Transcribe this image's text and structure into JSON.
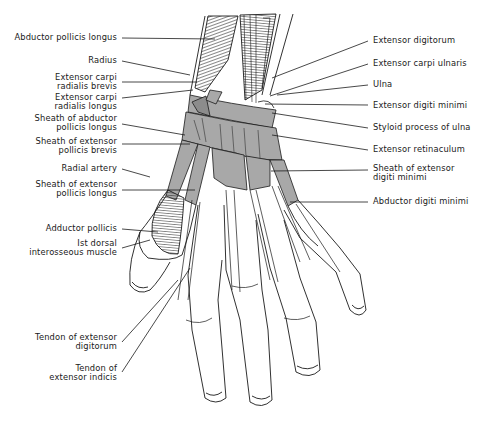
{
  "figure": {
    "colors": {
      "ink": "#1a1a1a",
      "sheath_fill": "#a8a8a8",
      "background": "#ffffff"
    }
  },
  "labels_left": [
    {
      "id": "abductor-pollicis-longus",
      "lines": [
        "Abductor pollicis longus"
      ],
      "x": 117,
      "y": 33,
      "lead": [
        [
          122,
          38
        ],
        [
          215,
          39
        ]
      ]
    },
    {
      "id": "radius",
      "lines": [
        "Radius"
      ],
      "x": 117,
      "y": 56,
      "lead": [
        [
          122,
          61
        ],
        [
          190,
          75
        ]
      ]
    },
    {
      "id": "extensor-carpi-radialis-brevis",
      "lines": [
        "Extensor carpi",
        "radialis brevis"
      ],
      "x": 117,
      "y": 73,
      "lead": [
        [
          122,
          82
        ],
        [
          197,
          82
        ]
      ]
    },
    {
      "id": "extensor-carpi-radialis-longus",
      "lines": [
        "Extensor carpi",
        "radialis longus"
      ],
      "x": 117,
      "y": 93,
      "lead": [
        [
          122,
          98
        ],
        [
          193,
          90
        ]
      ]
    },
    {
      "id": "sheath-of-abductor-pollicis-longus",
      "lines": [
        "Sheath of abductor",
        "pollicis longus"
      ],
      "x": 117,
      "y": 114,
      "lead": [
        [
          122,
          124
        ],
        [
          185,
          135
        ]
      ]
    },
    {
      "id": "sheath-of-extensor-pollicis-brevis",
      "lines": [
        "Sheath of extensor",
        "pollicis brevis"
      ],
      "x": 117,
      "y": 137,
      "lead": [
        [
          122,
          144
        ],
        [
          190,
          144
        ]
      ]
    },
    {
      "id": "radial-artery",
      "lines": [
        "Radial artery"
      ],
      "x": 117,
      "y": 164,
      "lead": [
        [
          122,
          169
        ],
        [
          150,
          177
        ]
      ]
    },
    {
      "id": "sheath-of-extensor-pollicis-longus",
      "lines": [
        "Sheath of extensor",
        "pollicis longus"
      ],
      "x": 117,
      "y": 180,
      "lead": [
        [
          122,
          190
        ],
        [
          195,
          190
        ]
      ]
    },
    {
      "id": "adductor-pollicis",
      "lines": [
        "Adductor pollicis"
      ],
      "x": 117,
      "y": 224,
      "lead": [
        [
          122,
          229
        ],
        [
          158,
          232
        ]
      ]
    },
    {
      "id": "first-dorsal-interosseous-muscle",
      "lines": [
        "Ist dorsal",
        "interosseous muscle"
      ],
      "x": 117,
      "y": 239,
      "lead": [
        [
          122,
          248
        ],
        [
          150,
          240
        ]
      ]
    },
    {
      "id": "tendon-of-extensor-digitorum",
      "lines": [
        "Tendon of extensor",
        "digitorum"
      ],
      "x": 117,
      "y": 333,
      "lead": [
        [
          122,
          342
        ],
        [
          178,
          280
        ]
      ]
    },
    {
      "id": "tendon-of-extensor-indicis",
      "lines": [
        "Tendon of",
        "extensor indicis"
      ],
      "x": 117,
      "y": 364,
      "lead": [
        [
          122,
          372
        ],
        [
          190,
          268
        ]
      ]
    }
  ],
  "labels_right": [
    {
      "id": "extensor-digitorum",
      "lines": [
        "Extensor digitorum"
      ],
      "x": 373,
      "y": 36,
      "lead": [
        [
          368,
          41
        ],
        [
          272,
          78
        ]
      ]
    },
    {
      "id": "extensor-carpi-ulnaris",
      "lines": [
        "Extensor carpi ulnaris"
      ],
      "x": 373,
      "y": 59,
      "lead": [
        [
          368,
          64
        ],
        [
          270,
          96
        ]
      ]
    },
    {
      "id": "ulna",
      "lines": [
        "Ulna"
      ],
      "x": 373,
      "y": 80,
      "lead": [
        [
          368,
          85
        ],
        [
          277,
          95
        ]
      ]
    },
    {
      "id": "extensor-digiti-minimi",
      "lines": [
        "Extensor digiti minimi"
      ],
      "x": 373,
      "y": 101,
      "lead": [
        [
          368,
          105
        ],
        [
          265,
          104
        ]
      ]
    },
    {
      "id": "styloid-process-of-ulna",
      "lines": [
        "Styloid process of ulna"
      ],
      "x": 373,
      "y": 123,
      "lead": [
        [
          368,
          128
        ],
        [
          272,
          113
        ]
      ]
    },
    {
      "id": "extensor-retinaculum",
      "lines": [
        "Extensor retinaculum"
      ],
      "x": 373,
      "y": 145,
      "lead": [
        [
          368,
          150
        ],
        [
          272,
          135
        ]
      ]
    },
    {
      "id": "sheath-of-extensor-digiti-minimi",
      "lines": [
        "Sheath of extensor",
        "digiti minimi"
      ],
      "x": 373,
      "y": 164,
      "lead": [
        [
          368,
          170
        ],
        [
          271,
          171
        ]
      ]
    },
    {
      "id": "abductor-digiti-minimi",
      "lines": [
        "Abductor digiti minimi"
      ],
      "x": 373,
      "y": 197,
      "lead": [
        [
          368,
          202
        ],
        [
          290,
          202
        ]
      ]
    }
  ]
}
